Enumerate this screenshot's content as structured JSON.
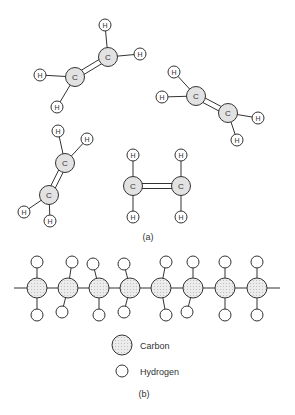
{
  "figure": {
    "part_a_label": "(a)",
    "part_b_label": "(b)",
    "atom_symbol_carbon": "C",
    "atom_symbol_hydrogen": "H",
    "legend": {
      "carbon_label": "Carbon",
      "hydrogen_label": "Hydrogen"
    },
    "colors": {
      "carbon_fill": "#e2e2e2",
      "hydrogen_fill": "#ffffff",
      "stroke": "#333333"
    },
    "part_a_description": "Four ethylene (C2H4) molecules with C=C double bonds",
    "part_b_description": "Polyethylene chain of 8 carbon atoms, each bonded to 2 hydrogens"
  }
}
